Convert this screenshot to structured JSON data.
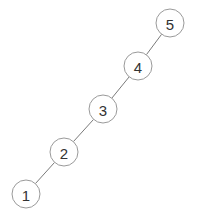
{
  "diagram": {
    "type": "tree",
    "node_radius": 14,
    "nodes": [
      {
        "id": "n1",
        "label": "1",
        "cx": 26,
        "cy": 194
      },
      {
        "id": "n2",
        "label": "2",
        "cx": 64,
        "cy": 152
      },
      {
        "id": "n3",
        "label": "3",
        "cx": 103,
        "cy": 109
      },
      {
        "id": "n4",
        "label": "4",
        "cx": 138,
        "cy": 66
      },
      {
        "id": "n5",
        "label": "5",
        "cx": 170,
        "cy": 23
      }
    ],
    "edges": [
      {
        "from": "n5",
        "to": "n4"
      },
      {
        "from": "n4",
        "to": "n3"
      },
      {
        "from": "n3",
        "to": "n2"
      },
      {
        "from": "n2",
        "to": "n1"
      }
    ]
  }
}
